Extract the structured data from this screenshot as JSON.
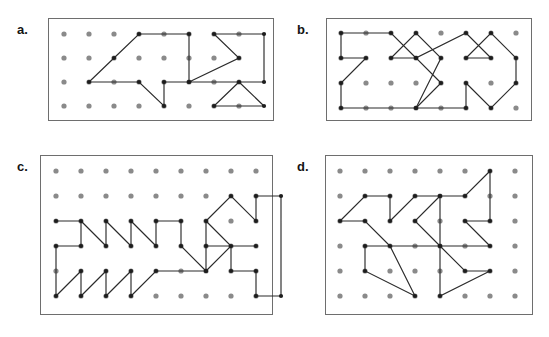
{
  "figure": {
    "panel_count": 4,
    "background_color": "#ffffff",
    "board_border_color": "#6e6e6e",
    "peg_color": "#8a8a8a",
    "outline_color": "#2b2b2b",
    "vertex_color": "#1d1d1d"
  },
  "panels": [
    {
      "label": "a.",
      "name": "panel-a",
      "box": {
        "left": 48,
        "top": 18,
        "width": 226,
        "height": 103
      },
      "label_pos": {
        "left": 17,
        "top": 23
      },
      "grid": {
        "cols": 8,
        "rows": 4,
        "origin_x": 15,
        "origin_y": 15,
        "step_x": 25,
        "step_y": 24,
        "peg_radius": 2.6
      },
      "shapes": [
        {
          "name": "polygon-a1",
          "points": "[[3,0],[5,0],[5,2],[4,2],[4,3],[3,2],[1,2],[2,1],[3,0]]",
          "closed": true
        },
        {
          "name": "polygon-a2",
          "points": "[[6,0],[8,0],[8,2],[7,2],[8,3],[6,3],[7,2],[5,2],[7,1],[6,0]]",
          "closed": true
        }
      ]
    },
    {
      "label": "b.",
      "name": "panel-b",
      "box": {
        "left": 326,
        "top": 18,
        "width": 206,
        "height": 103
      },
      "label_pos": {
        "left": 297,
        "top": 23
      },
      "grid": {
        "cols": 8,
        "rows": 4,
        "origin_x": 14,
        "origin_y": 14,
        "step_x": 25,
        "step_y": 25,
        "peg_radius": 2.6
      },
      "shapes": [
        {
          "name": "polygon-b1",
          "points": "[[0,0],[2,0],[3,1],[2,1],[3,0],[4,1],[3,3],[0,3],[0,2],[1,1],[0,1],[0,0]]",
          "closed": true
        },
        {
          "name": "polygon-b2",
          "points": "[[4,2],[3,1],[5,0],[6,1],[5,1],[6,0],[7,1],[7,2],[6,3],[5,2],[5,3],[3,3],[4,2]]",
          "closed": true
        }
      ]
    },
    {
      "label": "c.",
      "name": "panel-c",
      "box": {
        "left": 40,
        "top": 155,
        "width": 233,
        "height": 160
      },
      "label_pos": {
        "left": 17,
        "top": 160
      },
      "grid": {
        "cols": 9,
        "rows": 6,
        "origin_x": 15,
        "origin_y": 15,
        "step_x": 25,
        "step_y": 25,
        "peg_radius": 2.6
      },
      "shapes": [
        {
          "name": "polygon-c1",
          "points": "[[0,2],[1,2],[1,3],[0,3],[0,5],[1,4],[1,5],[2,4],[2,5],[3,4],[3,5],[4,4],[6,4],[5,3],[5,2],[4,2],[4,3],[3,2],[3,3],[2,2],[2,3],[1,2]]",
          "closed": false
        },
        {
          "name": "polygon-c2",
          "points": "[[6,2],[7,1],[8,2],[8,1],[9,1],[9,5],[8,5],[8,4],[7,4],[7,3],[8,3],[6,3],[6,2],[6,4],[7,3],[6,2]]",
          "closed": false
        }
      ]
    },
    {
      "label": "d.",
      "name": "panel-d",
      "box": {
        "left": 325,
        "top": 155,
        "width": 208,
        "height": 160
      },
      "label_pos": {
        "left": 297,
        "top": 160
      },
      "grid": {
        "cols": 8,
        "rows": 6,
        "origin_x": 14,
        "origin_y": 15,
        "step_x": 25,
        "step_y": 25,
        "peg_radius": 2.6
      },
      "shapes": [
        {
          "name": "polygon-d1",
          "points": "[[0,2],[1,1],[2,1],[2,2],[3,1],[4,1],[3,2],[4,3],[2,3],[3,5],[1,4],[1,3],[2,3],[1,2],[0,2]]",
          "closed": false
        },
        {
          "name": "polygon-d2",
          "points": "[[4,1],[5,1],[6,0],[6,2],[5,2],[6,3],[4,3],[5,4],[6,4],[4,5],[4,3],[4,1]]",
          "closed": false
        }
      ]
    }
  ]
}
